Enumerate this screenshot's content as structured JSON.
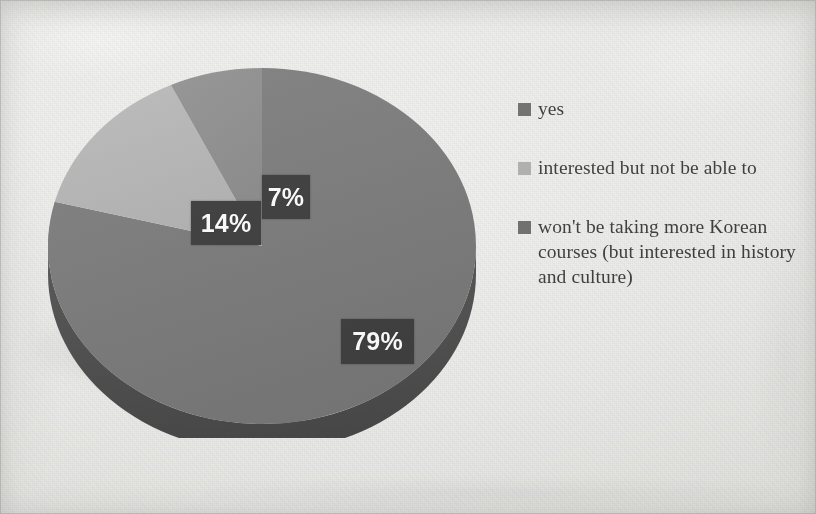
{
  "chart_data": {
    "type": "pie",
    "title": "",
    "subtitle": "",
    "xlabel": "",
    "ylabel": "",
    "legend_position": "right",
    "grid": false,
    "three_d": true,
    "start_angle_deg": 0,
    "direction": "clockwise",
    "categories": [
      "yes",
      "interested but not be able to",
      "won't be taking more Korean courses (but interested in history and culture)"
    ],
    "values": [
      79,
      14,
      7
    ],
    "value_labels": [
      "79%",
      "14%",
      "7%"
    ],
    "colors": [
      "#787878",
      "#b4b4b4",
      "#8c8c8c"
    ],
    "slices": [
      {
        "label": "yes",
        "value": 79,
        "value_label": "79%",
        "color": "#787878",
        "side_color": "#4a4a4a",
        "start_deg": 0,
        "end_deg": 284.4
      },
      {
        "label": "interested but not be able to",
        "value": 14,
        "value_label": "14%",
        "color": "#b4b4b4",
        "side_color": "#7d7d7d",
        "start_deg": 284.4,
        "end_deg": 334.8
      },
      {
        "label": "won't be taking more Korean courses (but interested in history and culture)",
        "value": 7,
        "value_label": "7%",
        "color": "#8c8c8c",
        "side_color": "#5f5f5f",
        "start_deg": 334.8,
        "end_deg": 360
      }
    ]
  },
  "labels": {
    "slice_79": "79%",
    "slice_14": "14%",
    "slice_7": "7%"
  },
  "legend": {
    "items": [
      {
        "label": "yes",
        "color": "#6e6e6e"
      },
      {
        "label": "interested but not be able to",
        "color": "#b0b0b0"
      },
      {
        "label": "won't be taking more Korean courses (but interested in history and culture)",
        "color": "#6e6e6e"
      }
    ]
  },
  "palette": {
    "background": "#ececea",
    "label_box": "#3a3a3a",
    "label_text": "#fbfbfb",
    "legend_text": "#3b3b3b"
  }
}
